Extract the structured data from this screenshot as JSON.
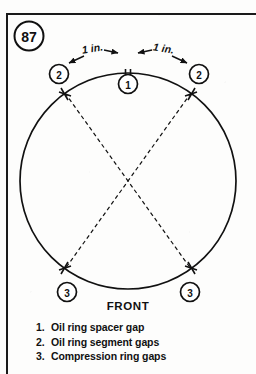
{
  "figure": {
    "number": "87",
    "orientation_label": "FRONT"
  },
  "diagram": {
    "title_markers": [
      {
        "id": "m-left-2",
        "label": "2",
        "meaning": "oil ring segment gap (left)"
      },
      {
        "id": "m-top-1",
        "label": "1",
        "meaning": "oil ring spacer gap (top center)"
      },
      {
        "id": "m-right-2",
        "label": "2",
        "meaning": "oil ring segment gap (right)"
      },
      {
        "id": "m-bottom-left-3",
        "label": "3",
        "meaning": "compression ring gap (bottom left)"
      },
      {
        "id": "m-bottom-right-3",
        "label": "3",
        "meaning": "compression ring gap (bottom right)"
      }
    ],
    "dimensions": [
      {
        "id": "dim-left",
        "label": "1 in."
      },
      {
        "id": "dim-right",
        "label": "1 in."
      }
    ]
  },
  "legend": {
    "items": [
      {
        "num": "1.",
        "text": "Oil ring spacer gap"
      },
      {
        "num": "2.",
        "text": "Oil ring segment gaps"
      },
      {
        "num": "3.",
        "text": "Compression ring gaps"
      }
    ]
  },
  "colors": {
    "ink": "#111111",
    "paper": "#fdfdfc"
  }
}
